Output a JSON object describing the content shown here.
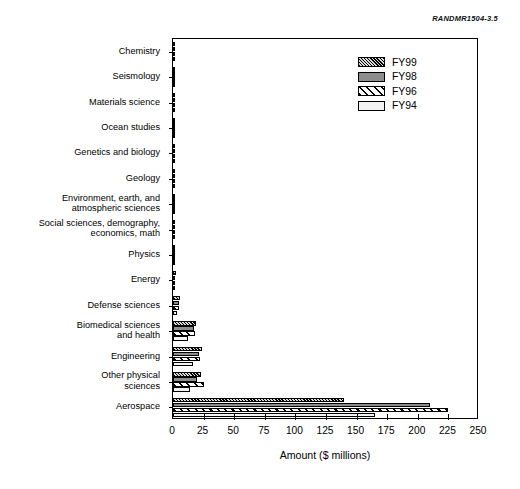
{
  "figure_id": "RANDMR1504-3.5",
  "legend": {
    "position": "top-right",
    "entries": [
      {
        "label": "FY99",
        "pattern": "dense-hatch",
        "color": "#4a4a4a"
      },
      {
        "label": "FY98",
        "pattern": "solid-gray",
        "color": "#8d8d8d"
      },
      {
        "label": "FY96",
        "pattern": "diagonal-stripe",
        "color": "#ffffff"
      },
      {
        "label": "FY94",
        "pattern": "plain-white",
        "color": "#f2f2f2"
      }
    ]
  },
  "chart_data": {
    "type": "bar",
    "orientation": "horizontal",
    "title": "",
    "xlabel": "Amount ($ millions)",
    "ylabel": "",
    "xlim": [
      0,
      250
    ],
    "xticks": [
      0,
      25,
      50,
      75,
      100,
      125,
      150,
      175,
      200,
      225,
      250
    ],
    "xticklabels": [
      "0",
      "25",
      "50",
      "75",
      "100",
      "125",
      "150",
      "175",
      "200",
      "225",
      "250"
    ],
    "grid": false,
    "categories": [
      "Chemistry",
      "Seismology",
      "Materials science",
      "Ocean studies",
      "Genetics and biology",
      "Geology",
      "Environment, earth, and\natmospheric sciences",
      "Social sciences, demography,\neconomics, math",
      "Physics",
      "Energy",
      "Defense sciences",
      "Biomedical sciences\nand health",
      "Engineering",
      "Other physical\nsciences",
      "Aerospace"
    ],
    "series": [
      {
        "name": "FY99",
        "values": [
          0.3,
          0.4,
          0.5,
          0.6,
          0.9,
          1.0,
          1.4,
          1.6,
          1.8,
          2.2,
          6.0,
          19.0,
          24.0,
          23.0,
          140.0
        ]
      },
      {
        "name": "FY98",
        "values": [
          0.2,
          0.3,
          0.4,
          0.5,
          0.7,
          0.8,
          1.1,
          1.3,
          1.5,
          1.8,
          4.5,
          17.0,
          21.0,
          20.0,
          210.0
        ]
      },
      {
        "name": "FY96",
        "values": [
          0.2,
          0.3,
          0.5,
          0.6,
          0.8,
          1.0,
          1.2,
          1.5,
          1.6,
          2.0,
          5.0,
          18.0,
          22.0,
          25.0,
          225.0
        ]
      },
      {
        "name": "FY94",
        "values": [
          0.1,
          0.2,
          0.3,
          0.4,
          0.5,
          0.6,
          0.8,
          1.0,
          1.1,
          1.4,
          3.5,
          12.0,
          16.0,
          14.0,
          165.0
        ]
      }
    ]
  }
}
